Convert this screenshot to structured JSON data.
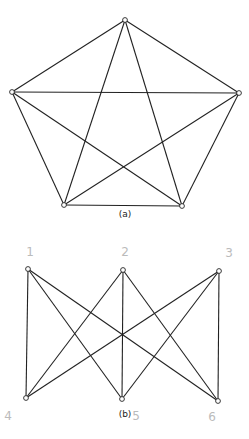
{
  "figures": [
    {
      "id": "a",
      "caption": "(a)",
      "caption_pos": [
        125,
        217
      ],
      "vertices": [
        {
          "x": 125,
          "y": 20
        },
        {
          "x": 12,
          "y": 92
        },
        {
          "x": 239,
          "y": 93
        },
        {
          "x": 64,
          "y": 205
        },
        {
          "x": 182,
          "y": 206
        }
      ],
      "edges": [
        [
          0,
          1
        ],
        [
          0,
          2
        ],
        [
          0,
          3
        ],
        [
          0,
          4
        ],
        [
          1,
          2
        ],
        [
          1,
          3
        ],
        [
          1,
          4
        ],
        [
          2,
          3
        ],
        [
          2,
          4
        ],
        [
          3,
          4
        ]
      ],
      "vertex_labels": []
    },
    {
      "id": "b",
      "caption": "(b)",
      "caption_pos": [
        125,
        417
      ],
      "vertices": [
        {
          "x": 28,
          "y": 269
        },
        {
          "x": 123,
          "y": 270
        },
        {
          "x": 219,
          "y": 271
        },
        {
          "x": 26,
          "y": 398
        },
        {
          "x": 122,
          "y": 399
        },
        {
          "x": 218,
          "y": 401
        }
      ],
      "edges": [
        [
          0,
          3
        ],
        [
          0,
          4
        ],
        [
          0,
          5
        ],
        [
          1,
          3
        ],
        [
          1,
          4
        ],
        [
          1,
          5
        ],
        [
          2,
          3
        ],
        [
          2,
          4
        ],
        [
          2,
          5
        ]
      ],
      "vertex_labels": [
        {
          "text": "1",
          "x": 30,
          "y": 256
        },
        {
          "text": "2",
          "x": 125,
          "y": 256
        },
        {
          "text": "3",
          "x": 229,
          "y": 257
        },
        {
          "text": "4",
          "x": 8,
          "y": 420
        },
        {
          "text": "5",
          "x": 136,
          "y": 420
        },
        {
          "text": "6",
          "x": 212,
          "y": 421
        }
      ]
    }
  ]
}
